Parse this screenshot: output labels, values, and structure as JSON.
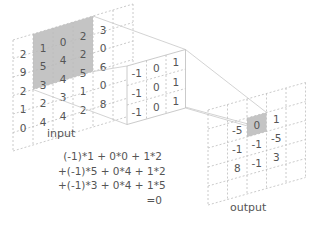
{
  "labels": {
    "input": "input",
    "output": "output"
  },
  "colors": {
    "highlight": "#c4c4c4",
    "grid": "#bdbdbd",
    "solid": "#b0b0b0",
    "text": "#555555"
  },
  "input": {
    "rows": 6,
    "cols": 6,
    "values": [
      [
        "",
        "1",
        "0",
        "2",
        "3",
        ""
      ],
      [
        "2",
        "5",
        "4",
        "2",
        "0",
        ""
      ],
      [
        "9",
        "3",
        "4",
        "5",
        "6",
        ""
      ],
      [
        "2",
        "2",
        "3",
        "1",
        "0",
        ""
      ],
      [
        "1",
        "4",
        "4",
        "2",
        "8",
        ""
      ],
      [
        "0",
        "",
        "",
        "",
        "",
        ""
      ]
    ],
    "highlight": {
      "row": 0,
      "col": 1,
      "size": 3
    }
  },
  "input_cells": [
    [
      "2",
      "1",
      "0",
      "2",
      "3"
    ],
    [
      "9",
      "5",
      "4",
      "2",
      "0"
    ],
    [
      "2",
      "3",
      "4",
      "5",
      "6"
    ],
    [
      "1",
      "2",
      "3",
      "1",
      "0"
    ],
    [
      "0",
      "4",
      "4",
      "2",
      "8"
    ]
  ],
  "kernel": [
    [
      "-1",
      "0",
      "1"
    ],
    [
      "-1",
      "0",
      "1"
    ],
    [
      "-1",
      "0",
      "1"
    ]
  ],
  "output": [
    [
      "-5",
      "0",
      "1"
    ],
    [
      "-1",
      "-1",
      "-5"
    ],
    [
      "8",
      "-1",
      "3"
    ]
  ],
  "output_highlight": {
    "row": 0,
    "col": 1
  },
  "equation": [
    "(-1)*1 +  0*0 + 1*2",
    "+(-1)*5 +  0*4 + 1*2",
    "+(-1)*3 +  0*4 + 1*5",
    "=0"
  ]
}
